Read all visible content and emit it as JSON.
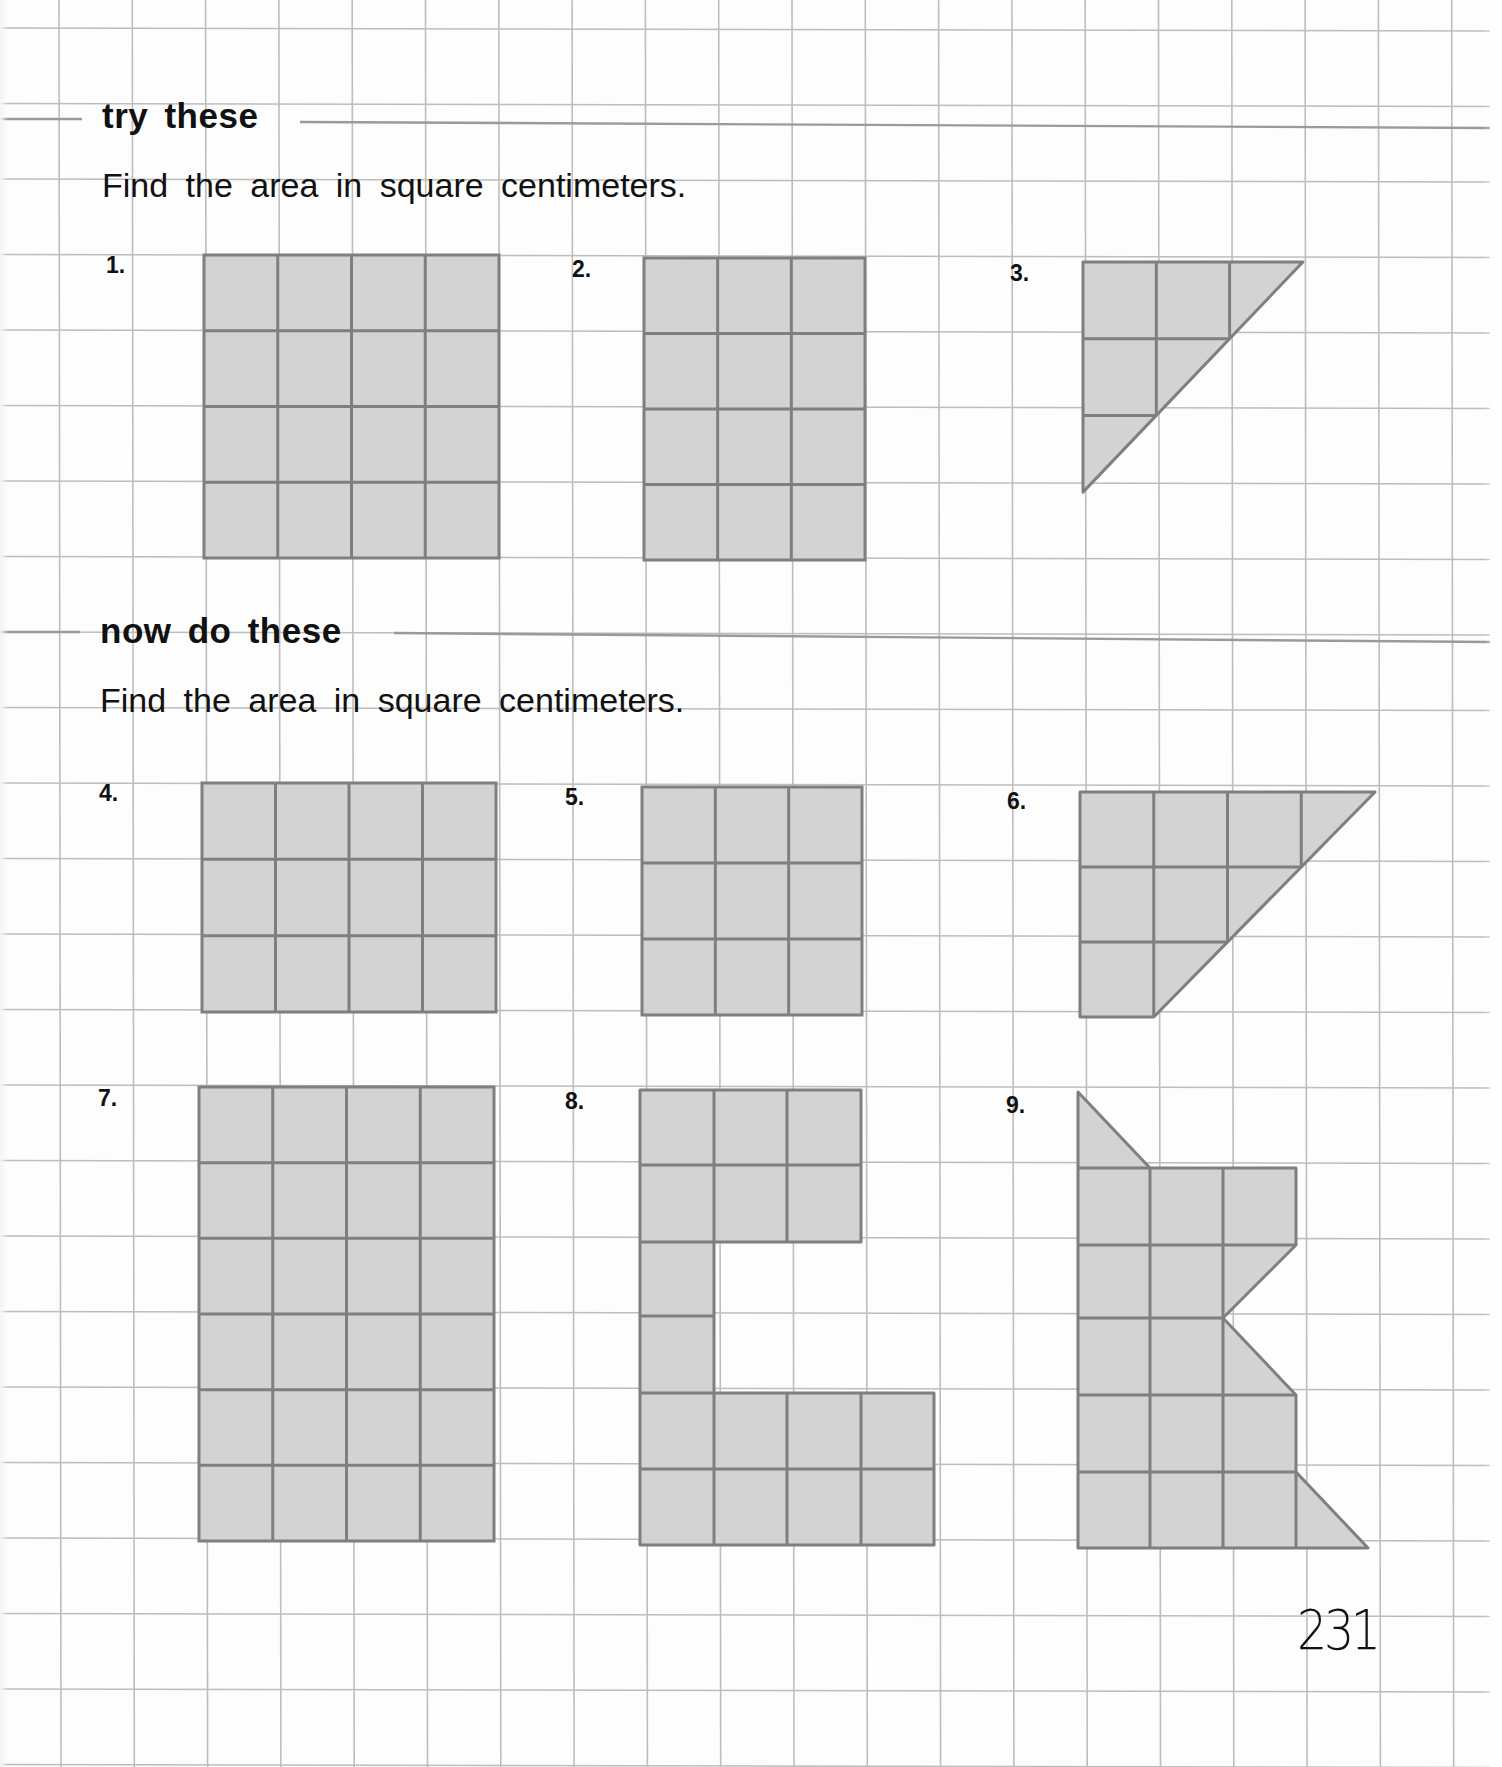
{
  "page": {
    "page_number": "231",
    "colors": {
      "grid_line": "#bdbdbd",
      "rule_line": "#9a9a9a",
      "shape_fill": "#d3d3d3",
      "shape_stroke": "#7f7f7f",
      "text": "#111111"
    }
  },
  "sections": [
    {
      "title": "try these",
      "instruction": "Find the area in square centimeters."
    },
    {
      "title": "now do these",
      "instruction": "Find the area in square centimeters."
    }
  ],
  "problems": [
    {
      "label": "1.",
      "shape": "rectangle",
      "cols": 4,
      "rows": 4
    },
    {
      "label": "2.",
      "shape": "rectangle",
      "cols": 3,
      "rows": 4
    },
    {
      "label": "3.",
      "shape": "right-triangle",
      "cols": 3,
      "rows": 3
    },
    {
      "label": "4.",
      "shape": "rectangle",
      "cols": 4,
      "rows": 3
    },
    {
      "label": "5.",
      "shape": "rectangle",
      "cols": 3,
      "rows": 3
    },
    {
      "label": "6.",
      "shape": "trapezoid",
      "cols": 4,
      "rows": 3
    },
    {
      "label": "7.",
      "shape": "rectangle",
      "cols": 4,
      "rows": 6
    },
    {
      "label": "8.",
      "shape": "c-shape",
      "cols": 4,
      "rows": 6
    },
    {
      "label": "9.",
      "shape": "polygon",
      "cols": 4,
      "rows": 6
    }
  ]
}
